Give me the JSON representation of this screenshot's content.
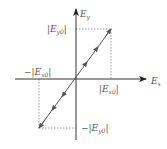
{
  "diagram": {
    "type": "linear-polarization",
    "axes": {
      "x_label": "E",
      "x_sub": "x",
      "y_label": "E",
      "y_sub": "y"
    },
    "labels": {
      "pos_ey0": "|E",
      "pos_ey0_sub": "y0",
      "pos_ey0_close": "|",
      "neg_ex0": "−|E",
      "neg_ex0_sub": "x0",
      "neg_ex0_close": "|",
      "pos_ex0": "|E",
      "pos_ex0_sub": "x0",
      "pos_ex0_close": "|",
      "neg_ey0": "−|E",
      "neg_ey0_sub": "y0",
      "neg_ey0_close": "|"
    },
    "colors": {
      "axis": "#333333",
      "line": "#555555",
      "dashed": "#777777",
      "text": "#555555"
    }
  }
}
